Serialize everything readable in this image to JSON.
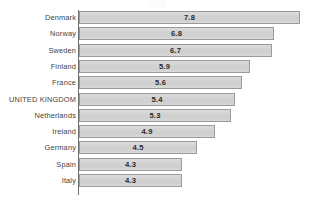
{
  "chart_data": {
    "type": "bar",
    "orientation": "horizontal",
    "title": "",
    "subtitle": "",
    "xlabel": "",
    "ylabel": "",
    "grid": false,
    "legend": null,
    "axis_line": "vertical category axis at left of bars",
    "value_labels_inside_bars": true,
    "categories": [
      "Denmark",
      "Norway",
      "Sweden",
      "Finland",
      "France",
      "UNITED KINGDOM",
      "Netherlands",
      "Ireland",
      "Germany",
      "Spain",
      "Italy"
    ],
    "values": [
      7.8,
      6.8,
      6.7,
      5.9,
      5.6,
      5.4,
      5.3,
      4.9,
      4.5,
      4.3,
      4.3
    ],
    "value_text": [
      "7.8",
      "6.8",
      "6.7",
      "5.9",
      "5.6",
      "5.4",
      "5.3",
      "4.9",
      "4.5",
      "4.3",
      "4.3"
    ],
    "xlim": [
      2.3,
      7.8
    ],
    "highlighted_category": "UNITED KINGDOM",
    "colors": {
      "bar_fill": "#d5d5d5",
      "bar_border": "#9a9a9a",
      "axis": "#6e6e6e",
      "label_text": "#3f3f3f",
      "value_text": "#2b2b2b",
      "background": "#ffffff"
    }
  },
  "rows": [
    {
      "label": "Denmark",
      "value_text": "7.8",
      "bar_px": 221
    },
    {
      "label": "Norway",
      "value_text": "6.8",
      "bar_px": 195
    },
    {
      "label": "Sweden",
      "value_text": "6.7",
      "bar_px": 193
    },
    {
      "label": "Finland",
      "value_text": "5.9",
      "bar_px": 171
    },
    {
      "label": "France",
      "value_text": "5.6",
      "bar_px": 163
    },
    {
      "label": "UNITED KINGDOM",
      "value_text": "5.4",
      "bar_px": 156
    },
    {
      "label": "Netherlands",
      "value_text": "5.3",
      "bar_px": 152
    },
    {
      "label": "Ireland",
      "value_text": "4.9",
      "bar_px": 136
    },
    {
      "label": "Germany",
      "value_text": "4.5",
      "bar_px": 118
    },
    {
      "label": "Spain",
      "value_text": "4.3",
      "bar_px": 103
    },
    {
      "label": "Italy",
      "value_text": "4.3",
      "bar_px": 103
    }
  ]
}
